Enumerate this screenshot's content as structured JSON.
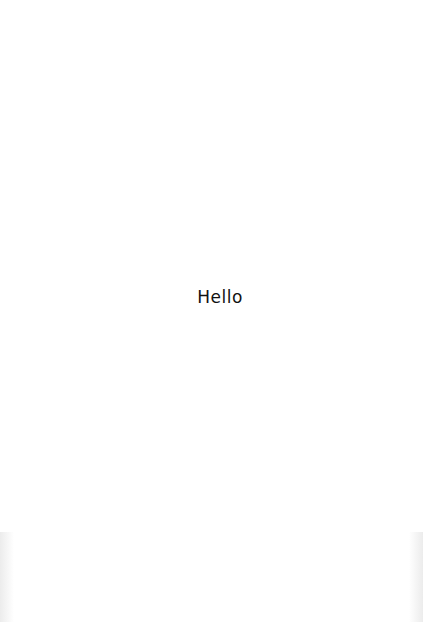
{
  "page": {
    "greeting_text": "Hello",
    "background_color": "#ffffff",
    "text_color": "#111111"
  }
}
